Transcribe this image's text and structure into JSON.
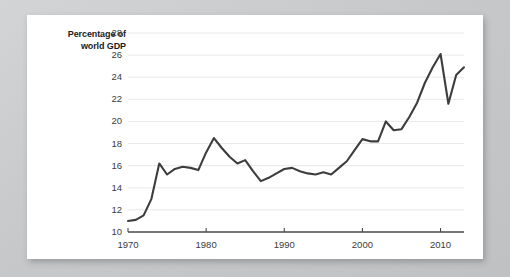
{
  "figure": {
    "background_color": "#c8cacb",
    "card_color": "#ffffff",
    "line_color": "#3d3d3d",
    "grid_color": "#e9e9e9",
    "axis_color": "#4a4a4a",
    "tick_text_color": "#3b3b3b",
    "label_text_color": "#1b1b1b"
  },
  "axis_title": {
    "line1": "Percentage of",
    "line2": "world GDP"
  },
  "chart_data": {
    "type": "line",
    "title": "",
    "subtitle": "",
    "xlabel": "",
    "ylabel": "Percentage of world GDP",
    "xlim": [
      1970,
      2013
    ],
    "ylim": [
      10,
      28
    ],
    "ytick_step": 2,
    "grid": true,
    "grid_axis": "y",
    "legend": "none",
    "yticks": [
      10,
      12,
      14,
      16,
      18,
      20,
      22,
      24,
      26,
      28
    ],
    "ytick_labels": [
      "10",
      "12",
      "14",
      "16",
      "18",
      "20",
      "22",
      "24",
      "26",
      "28"
    ],
    "xticks": [
      1970,
      1980,
      1990,
      2000,
      2010
    ],
    "xtick_labels": [
      "1970",
      "1980",
      "1990",
      "2000",
      "2010"
    ],
    "x": [
      1970,
      1971,
      1972,
      1973,
      1974,
      1975,
      1976,
      1977,
      1978,
      1979,
      1980,
      1981,
      1982,
      1983,
      1984,
      1985,
      1986,
      1987,
      1988,
      1989,
      1990,
      1991,
      1992,
      1993,
      1994,
      1995,
      1996,
      1997,
      1998,
      1999,
      2000,
      2001,
      2002,
      2003,
      2004,
      2005,
      2006,
      2007,
      2008,
      2009,
      2010,
      2011,
      2012,
      2013
    ],
    "values": [
      11.0,
      11.1,
      11.5,
      13.0,
      16.2,
      15.2,
      15.7,
      15.9,
      15.8,
      15.6,
      17.2,
      18.5,
      17.6,
      16.8,
      16.2,
      16.5,
      15.5,
      14.6,
      14.9,
      15.3,
      15.7,
      15.8,
      15.5,
      15.3,
      15.2,
      15.4,
      15.2,
      15.8,
      16.4,
      17.4,
      18.4,
      18.2,
      18.2,
      20.0,
      19.2,
      19.3,
      20.4,
      21.7,
      23.5,
      24.9,
      26.1,
      21.6,
      24.2,
      24.9
    ],
    "series": [
      {
        "name": "Percentage of world GDP",
        "values": [
          11.0,
          11.1,
          11.5,
          13.0,
          16.2,
          15.2,
          15.7,
          15.9,
          15.8,
          15.6,
          17.2,
          18.5,
          17.6,
          16.8,
          16.2,
          16.5,
          15.5,
          14.6,
          14.9,
          15.3,
          15.7,
          15.8,
          15.5,
          15.3,
          15.2,
          15.4,
          15.2,
          15.8,
          16.4,
          17.4,
          18.4,
          18.2,
          18.2,
          20.0,
          19.2,
          19.3,
          20.4,
          21.7,
          23.5,
          24.9,
          26.1,
          21.6,
          24.2,
          24.9
        ]
      }
    ]
  }
}
